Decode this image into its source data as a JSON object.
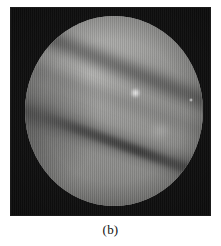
{
  "figure": {
    "caption": "(b)",
    "panel": {
      "label": "endoscopic-grayscale-photograph",
      "background_color": "#0a0a0a",
      "border_color": "#1a1a1a",
      "width_px": 201,
      "height_px": 209,
      "left_px": 10,
      "top_px": 7
    },
    "field_of_view": {
      "shape": "circle",
      "center_x_px": 113,
      "center_y_px": 111,
      "radius_px": 93,
      "base_color": "#9a9a98",
      "highlight_color": "#ffffff",
      "shadow_color": "#2a2a2a"
    },
    "features": [
      {
        "name": "dark-diagonal-band-upper",
        "angle_deg": 22,
        "tone": "#303030"
      },
      {
        "name": "dark-diagonal-band-lower",
        "angle_deg": 19,
        "tone": "#343434"
      },
      {
        "name": "specular-highlight-main",
        "x_px": 130,
        "y_px": 93
      },
      {
        "name": "specular-highlight-small",
        "x_px": 190,
        "y_px": 100
      },
      {
        "name": "soft-bright-patch",
        "x_px": 155,
        "y_px": 129
      }
    ]
  },
  "page": {
    "background_color": "#ffffff",
    "width_px": 221,
    "height_px": 246
  }
}
